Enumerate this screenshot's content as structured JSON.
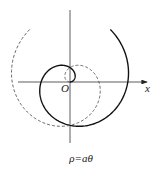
{
  "diagram": {
    "caption": "ρ=aθ",
    "origin_label": "O",
    "x_axis_label": "x",
    "curves": [
      {
        "name": "spiral-theta-positive",
        "style": "solid",
        "theta_range": [
          0,
          7.2
        ]
      },
      {
        "name": "spiral-theta-negative",
        "style": "dashed",
        "theta_range": [
          -7.2,
          0
        ]
      }
    ]
  }
}
